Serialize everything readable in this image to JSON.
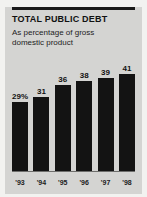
{
  "chart_data": {
    "type": "bar",
    "title": "TOTAL PUBLIC DEBT",
    "subtitle": "As percentage of gross domestic product",
    "categories": [
      "'93",
      "'94",
      "'95",
      "'96",
      "'97",
      "'98"
    ],
    "values": [
      29,
      31,
      36,
      38,
      39,
      41
    ],
    "value_labels": [
      "29%",
      "31",
      "36",
      "38",
      "39",
      "41"
    ],
    "xlabel": "",
    "ylabel": "",
    "ylim": [
      0,
      48
    ],
    "grid": false,
    "legend": "none",
    "bar_color": "#131313",
    "panel_color": "#d4d4d2",
    "background_color": "#f2f2f0",
    "rule_color": "#1a1a1a"
  }
}
